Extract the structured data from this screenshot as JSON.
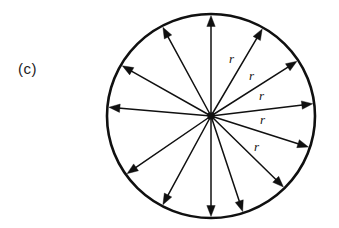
{
  "figure": {
    "panel_label": "(c)",
    "panel_label_pos": {
      "x": 18,
      "y": 60
    },
    "background_color": "#ffffff",
    "ink_color": "#101010",
    "circle": {
      "center_x": 211,
      "center_y": 116,
      "radius_x": 104,
      "radius_y": 102,
      "stroke_width": 2.6
    },
    "hub": {
      "center_x": 211,
      "center_y": 116,
      "size": 7
    },
    "arrow_count": 12,
    "arrow_stroke_width": 1.5,
    "arrow_head_length": 11,
    "arrow_head_width": 4.2,
    "arrows": [
      {
        "id": "arrow-0",
        "angle_deg": 90,
        "label": "up"
      },
      {
        "id": "arrow-1",
        "angle_deg": 60,
        "label": "upper-right-steep"
      },
      {
        "id": "arrow-2",
        "angle_deg": 33,
        "label": "upper-right"
      },
      {
        "id": "arrow-3",
        "angle_deg": 7,
        "label": "right-upper"
      },
      {
        "id": "arrow-4",
        "angle_deg": -18,
        "label": "right-lower"
      },
      {
        "id": "arrow-5",
        "angle_deg": -45,
        "label": "lower-right"
      },
      {
        "id": "arrow-6",
        "angle_deg": -72,
        "label": "lower-right-steep"
      },
      {
        "id": "arrow-7",
        "angle_deg": -90,
        "label": "down"
      },
      {
        "id": "arrow-8",
        "angle_deg": -118,
        "label": "lower-left-steep"
      },
      {
        "id": "arrow-9",
        "angle_deg": -145,
        "label": "lower-left"
      },
      {
        "id": "arrow-10",
        "angle_deg": 175,
        "label": "left"
      },
      {
        "id": "arrow-11",
        "angle_deg": 150,
        "label": "upper-left"
      },
      {
        "id": "arrow-12",
        "angle_deg": 118,
        "label": "upper-left-steep"
      }
    ],
    "radius_labels": [
      {
        "id": "radius-label-1",
        "text": "r",
        "x": 229,
        "y": 52
      },
      {
        "id": "radius-label-2",
        "text": "r",
        "x": 249,
        "y": 69
      },
      {
        "id": "radius-label-3",
        "text": "r",
        "x": 259,
        "y": 89
      },
      {
        "id": "radius-label-4",
        "text": "r",
        "x": 260,
        "y": 113
      },
      {
        "id": "radius-label-5",
        "text": "r",
        "x": 254,
        "y": 140
      }
    ]
  }
}
